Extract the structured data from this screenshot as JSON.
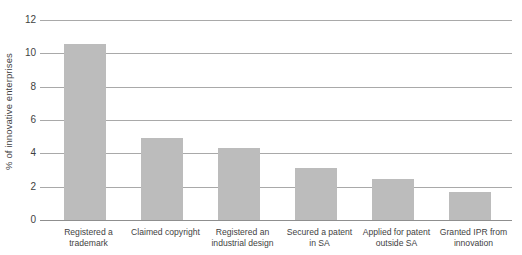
{
  "chart_data": {
    "type": "bar",
    "title": "",
    "subtitle": "",
    "xlabel": "",
    "ylabel": "% of innovative enterprises",
    "ylim": [
      0,
      12
    ],
    "yticks": [
      0,
      2,
      4,
      6,
      8,
      10,
      12
    ],
    "ytick_labels": [
      "0",
      "2",
      "4",
      "6",
      "8",
      "10",
      "12"
    ],
    "grid": true,
    "legend": false,
    "legend_position": "none",
    "bar_color": "#bcbcbc",
    "grid_color": "#a9a9a9",
    "axis_color": "#8f8f8f",
    "categories": [
      "Registered a trademark",
      "Claimed copyright",
      "Registered an industrial design",
      "Secured a patent in SA",
      "Applied for patent outside SA",
      "Granted IPR from innovation"
    ],
    "category_lines": [
      [
        "Registered a",
        "trademark"
      ],
      [
        "Claimed copyright",
        ""
      ],
      [
        "Registered an",
        "industrial design"
      ],
      [
        "Secured a patent",
        "in SA"
      ],
      [
        "Applied for patent",
        "outside SA"
      ],
      [
        "Granted IPR from",
        "innovation"
      ]
    ],
    "values": [
      10.55,
      4.9,
      4.3,
      3.1,
      2.45,
      1.7
    ]
  }
}
